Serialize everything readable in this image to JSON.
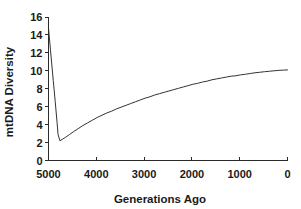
{
  "chart_data": {
    "type": "line",
    "title": "",
    "xlabel": "Generations Ago",
    "ylabel": "mtDNA Diversity",
    "xlim": [
      5000,
      0
    ],
    "ylim": [
      0,
      16
    ],
    "x_reversed": true,
    "grid": false,
    "legend": null,
    "legend_position": "none",
    "xticks": [
      5000,
      4000,
      3000,
      2000,
      1000,
      0
    ],
    "xtick_labels": [
      "5000",
      "4000",
      "3000",
      "2000",
      "1000",
      "0"
    ],
    "yticks": [
      0,
      2,
      4,
      6,
      8,
      10,
      12,
      14,
      16
    ],
    "ytick_labels": [
      "0",
      "2",
      "4",
      "6",
      "8",
      "10",
      "12",
      "14",
      "16"
    ],
    "line_color": "#333333",
    "series": [
      {
        "name": "mtDNA diversity",
        "x": [
          5000,
          4960,
          4900,
          4860,
          4820,
          4800,
          4760,
          4700,
          4640,
          4560,
          4480,
          4380,
          4280,
          4180,
          4080,
          3980,
          3880,
          3780,
          3680,
          3580,
          3480,
          3380,
          3280,
          3180,
          3080,
          2980,
          2880,
          2780,
          2680,
          2580,
          2480,
          2380,
          2280,
          2180,
          2080,
          1980,
          1880,
          1780,
          1680,
          1580,
          1480,
          1380,
          1280,
          1180,
          1080,
          980,
          880,
          780,
          680,
          580,
          480,
          380,
          280,
          180,
          80,
          0
        ],
        "y": [
          14.8,
          12.4,
          8.9,
          6.6,
          4.2,
          2.9,
          2.2,
          2.4,
          2.6,
          2.9,
          3.2,
          3.55,
          3.9,
          4.2,
          4.5,
          4.8,
          5.05,
          5.3,
          5.5,
          5.75,
          5.95,
          6.15,
          6.35,
          6.55,
          6.75,
          6.95,
          7.1,
          7.3,
          7.45,
          7.6,
          7.75,
          7.9,
          8.05,
          8.2,
          8.35,
          8.5,
          8.6,
          8.75,
          8.85,
          9.0,
          9.1,
          9.2,
          9.3,
          9.4,
          9.45,
          9.55,
          9.62,
          9.7,
          9.78,
          9.84,
          9.9,
          9.95,
          10.0,
          10.05,
          10.08,
          10.1
        ]
      }
    ],
    "annotations": [
      {
        "text": "peak",
        "x": 5000,
        "y": 14.8
      },
      {
        "text": "minimum",
        "x": 4760,
        "y": 2.2
      },
      {
        "text": "present",
        "x": 0,
        "y": 10.1
      }
    ]
  },
  "axes": {
    "x_axis_title": "Generations Ago",
    "y_axis_title": "mtDNA Diversity"
  }
}
